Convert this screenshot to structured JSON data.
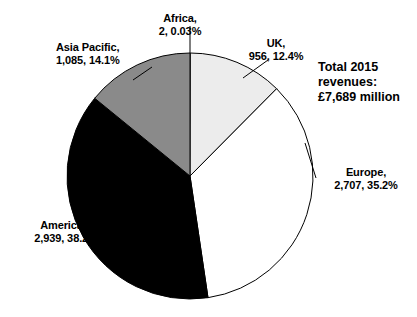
{
  "chart_data": {
    "type": "pie",
    "title": "",
    "total_label": {
      "line1": "Total 2015",
      "line2": "revenues:",
      "line3": "£7,689 million"
    },
    "total_value": 7689,
    "units": "£ million",
    "start_angle_deg": 0,
    "direction": "clockwise",
    "legend_position": "none",
    "categories": [
      "Africa",
      "UK",
      "Europe",
      "Americas",
      "Asia Pacific"
    ],
    "values": [
      2,
      956,
      2707,
      2939,
      1085
    ],
    "percents": [
      0.03,
      12.4,
      35.2,
      38.2,
      14.1
    ],
    "slices": [
      {
        "name": "Africa",
        "value": 2,
        "value_text": "2",
        "percent": 0.03,
        "percent_text": "0.03%",
        "color": "#ffffff",
        "label_line1": "Africa,",
        "label_line2": "2, 0.03%"
      },
      {
        "name": "UK",
        "value": 956,
        "value_text": "956",
        "percent": 12.4,
        "percent_text": "12.4%",
        "color": "#ececec",
        "label_line1": "UK,",
        "label_line2": "956, 12.4%"
      },
      {
        "name": "Europe",
        "value": 2707,
        "value_text": "2,707",
        "percent": 35.2,
        "percent_text": "35.2%",
        "color": "#ffffff",
        "label_line1": "Europe,",
        "label_line2": "2,707, 35.2%"
      },
      {
        "name": "Americas",
        "value": 2939,
        "value_text": "2,939",
        "percent": 38.2,
        "percent_text": "38.2%",
        "color": "#000000",
        "label_line1": "Americas,",
        "label_line2": "2,939, 38.2%"
      },
      {
        "name": "Asia Pacific",
        "value": 1085,
        "value_text": "1,085",
        "percent": 14.1,
        "percent_text": "14.1%",
        "color": "#8a8a8a",
        "label_line1": "Asia Pacific,",
        "label_line2": "1,085, 14.1%"
      }
    ],
    "geometry": {
      "center_x": 190,
      "center_y": 176,
      "radius": 123,
      "outline_color": "#000000"
    }
  }
}
